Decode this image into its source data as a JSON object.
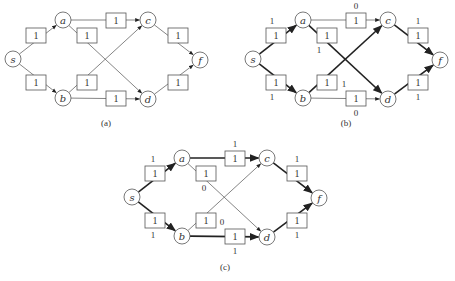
{
  "nodes": [
    {
      "id": "s",
      "label": "s",
      "x": 13,
      "y": 59
    },
    {
      "id": "a",
      "label": "a",
      "x": 63,
      "y": 20
    },
    {
      "id": "b",
      "label": "b",
      "x": 63,
      "y": 98
    },
    {
      "id": "c",
      "label": "c",
      "x": 148,
      "y": 20
    },
    {
      "id": "d",
      "label": "d",
      "x": 148,
      "y": 99
    },
    {
      "id": "f",
      "label": "f",
      "x": 200,
      "y": 60
    }
  ],
  "edges": [
    {
      "id": "s-a",
      "from": "s",
      "to": "a",
      "capacity": "1",
      "box": {
        "x": 26,
        "y": 28
      }
    },
    {
      "id": "s-b",
      "from": "s",
      "to": "b",
      "capacity": "1",
      "box": {
        "x": 26,
        "y": 75
      }
    },
    {
      "id": "a-c",
      "from": "a",
      "to": "c",
      "capacity": "1",
      "box": {
        "x": 106,
        "y": 13
      }
    },
    {
      "id": "a-d",
      "from": "a",
      "to": "d",
      "capacity": "1",
      "box": {
        "x": 77,
        "y": 28
      }
    },
    {
      "id": "b-c",
      "from": "b",
      "to": "c",
      "capacity": "1",
      "box": {
        "x": 77,
        "y": 75
      }
    },
    {
      "id": "b-d",
      "from": "b",
      "to": "d",
      "capacity": "1",
      "box": {
        "x": 106,
        "y": 91
      }
    },
    {
      "id": "c-f",
      "from": "c",
      "to": "f",
      "capacity": "1",
      "box": {
        "x": 168,
        "y": 28
      }
    },
    {
      "id": "d-f",
      "from": "d",
      "to": "f",
      "capacity": "1",
      "box": {
        "x": 168,
        "y": 75
      }
    }
  ],
  "diagrams": [
    {
      "id": "a",
      "caption": "(a)",
      "offset": {
        "x": 0,
        "y": 0
      },
      "caption_pos": {
        "x": 106,
        "y": 126
      },
      "flows": {}
    },
    {
      "id": "b",
      "caption": "(b)",
      "offset": {
        "x": 240,
        "y": 0
      },
      "caption_pos": {
        "x": 346,
        "y": 126
      },
      "flows": {
        "s-a": {
          "value": "1",
          "dx": 6,
          "dy": -4,
          "thick": true
        },
        "s-b": {
          "value": "1",
          "dx": 6,
          "dy": 25,
          "thick": true
        },
        "a-c": {
          "value": "0",
          "dx": 10,
          "dy": -4,
          "thick": false
        },
        "a-d": {
          "value": "1",
          "dx": 2,
          "dy": 25,
          "thick": true
        },
        "b-c": {
          "value": "1",
          "dx": 27,
          "dy": 12,
          "thick": true
        },
        "b-d": {
          "value": "0",
          "dx": 10,
          "dy": 25,
          "thick": false
        },
        "c-f": {
          "value": "1",
          "dx": 10,
          "dy": -4,
          "thick": true
        },
        "d-f": {
          "value": "1",
          "dx": 10,
          "dy": 25,
          "thick": true
        }
      }
    },
    {
      "id": "c",
      "caption": "(c)",
      "offset": {
        "x": 119,
        "y": 138
      },
      "caption_pos": {
        "x": 225,
        "y": 270
      },
      "flows": {
        "s-a": {
          "value": "1",
          "dx": 8,
          "dy": -4,
          "thick": true
        },
        "s-b": {
          "value": "1",
          "dx": 8,
          "dy": 25,
          "thick": true
        },
        "a-c": {
          "value": "1",
          "dx": 10,
          "dy": -4,
          "thick": true
        },
        "a-d": {
          "value": "0",
          "dx": 8,
          "dy": 25,
          "thick": false
        },
        "b-c": {
          "value": "0",
          "dx": 26,
          "dy": 12,
          "thick": false
        },
        "b-d": {
          "value": "1",
          "dx": 10,
          "dy": 25,
          "thick": true
        },
        "c-f": {
          "value": "1",
          "dx": 10,
          "dy": -4,
          "thick": true
        },
        "d-f": {
          "value": "1",
          "dx": 10,
          "dy": 25,
          "thick": true
        }
      }
    }
  ],
  "layout": {
    "node_radius": 8,
    "box_w": 20,
    "box_h": 15
  }
}
